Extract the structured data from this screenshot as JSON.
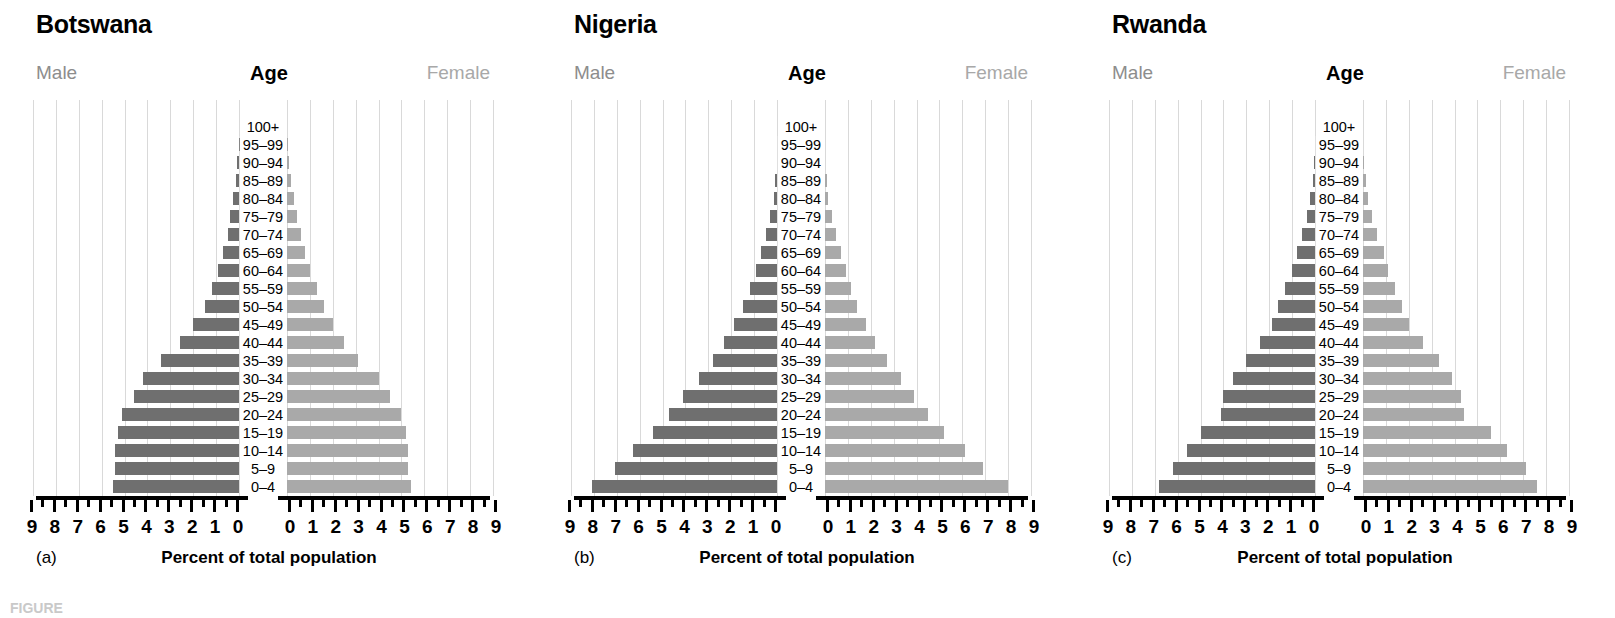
{
  "figure": {
    "caption": "FIGURE",
    "axis_title": "Percent of total population",
    "male_label": "Male",
    "female_label": "Female",
    "age_header": "Age",
    "male_color": "#6f6f6f",
    "female_color": "#a9a9a9",
    "grid_color": "#d9d9d9"
  },
  "age_groups": [
    "0–4",
    "5–9",
    "10–14",
    "15–19",
    "20–24",
    "25–29",
    "30–34",
    "35–39",
    "40–44",
    "45–49",
    "50–54",
    "55–59",
    "60–64",
    "65–69",
    "70–74",
    "75–79",
    "80–84",
    "85–89",
    "90–94",
    "95–99",
    "100+"
  ],
  "axis": {
    "ticks": [
      0,
      1,
      2,
      3,
      4,
      5,
      6,
      7,
      8,
      9
    ],
    "tick_labels_left": [
      "9",
      "8",
      "7",
      "6",
      "5",
      "4",
      "3",
      "2",
      "1",
      "0"
    ],
    "tick_labels_right": [
      "0",
      "1",
      "2",
      "3",
      "4",
      "5",
      "6",
      "7",
      "8",
      "9"
    ],
    "min": 0,
    "max": 9,
    "minor_per_major": 2
  },
  "panels": [
    {
      "letter": "(a)",
      "country": "Botswana",
      "chart_data": {
        "type": "bar",
        "title": "Botswana",
        "xlabel": "Percent of total population",
        "ylabel": "Age",
        "xlim": [
          0,
          9
        ],
        "grid": true,
        "categories": [
          "0–4",
          "5–9",
          "10–14",
          "15–19",
          "20–24",
          "25–29",
          "30–34",
          "35–39",
          "40–44",
          "45–49",
          "50–54",
          "55–59",
          "60–64",
          "65–69",
          "70–74",
          "75–79",
          "80–84",
          "85–89",
          "90–94",
          "95–99",
          "100+"
        ],
        "series": [
          {
            "name": "Male",
            "values": [
              5.5,
              5.4,
              5.4,
              5.3,
              5.1,
              4.6,
              4.2,
              3.4,
              2.6,
              2.0,
              1.5,
              1.2,
              0.9,
              0.7,
              0.5,
              0.4,
              0.25,
              0.15,
              0.07,
              0.02,
              0.0
            ]
          },
          {
            "name": "Female",
            "values": [
              5.4,
              5.3,
              5.3,
              5.2,
              5.0,
              4.5,
              4.0,
              3.1,
              2.5,
              2.0,
              1.6,
              1.3,
              1.0,
              0.8,
              0.6,
              0.45,
              0.3,
              0.18,
              0.08,
              0.03,
              0.0
            ]
          }
        ]
      }
    },
    {
      "letter": "(b)",
      "country": "Nigeria",
      "chart_data": {
        "type": "bar",
        "title": "Nigeria",
        "xlabel": "Percent of total population",
        "ylabel": "Age",
        "xlim": [
          0,
          9
        ],
        "grid": true,
        "categories": [
          "0–4",
          "5–9",
          "10–14",
          "15–19",
          "20–24",
          "25–29",
          "30–34",
          "35–39",
          "40–44",
          "45–49",
          "50–54",
          "55–59",
          "60–64",
          "65–69",
          "70–74",
          "75–79",
          "80–84",
          "85–89",
          "90–94",
          "95–99",
          "100+"
        ],
        "series": [
          {
            "name": "Male",
            "values": [
              8.1,
              7.1,
              6.3,
              5.4,
              4.7,
              4.1,
              3.4,
              2.8,
              2.3,
              1.9,
              1.5,
              1.2,
              0.9,
              0.7,
              0.5,
              0.3,
              0.15,
              0.08,
              0.0,
              0.0,
              0.0
            ]
          },
          {
            "name": "Female",
            "values": [
              8.0,
              6.9,
              6.1,
              5.2,
              4.5,
              3.9,
              3.3,
              2.7,
              2.2,
              1.8,
              1.4,
              1.15,
              0.9,
              0.7,
              0.5,
              0.3,
              0.15,
              0.08,
              0.0,
              0.0,
              0.0
            ]
          }
        ]
      }
    },
    {
      "letter": "(c)",
      "country": "Rwanda",
      "chart_data": {
        "type": "bar",
        "title": "Rwanda",
        "xlabel": "Percent of total population",
        "ylabel": "Age",
        "xlim": [
          0,
          9
        ],
        "grid": true,
        "categories": [
          "0–4",
          "5–9",
          "10–14",
          "15–19",
          "20–24",
          "25–29",
          "30–34",
          "35–39",
          "40–44",
          "45–49",
          "50–54",
          "55–59",
          "60–64",
          "65–69",
          "70–74",
          "75–79",
          "80–84",
          "85–89",
          "90–94",
          "95–99",
          "100+"
        ],
        "series": [
          {
            "name": "Male",
            "values": [
              6.8,
              6.2,
              5.6,
              5.0,
              4.1,
              4.0,
              3.6,
              3.0,
              2.4,
              1.9,
              1.6,
              1.3,
              1.0,
              0.8,
              0.55,
              0.35,
              0.2,
              0.1,
              0.04,
              0.0,
              0.0
            ]
          },
          {
            "name": "Female",
            "values": [
              7.6,
              7.1,
              6.3,
              5.6,
              4.4,
              4.3,
              3.9,
              3.3,
              2.6,
              2.0,
              1.7,
              1.4,
              1.1,
              0.9,
              0.6,
              0.4,
              0.22,
              0.12,
              0.05,
              0.0,
              0.0
            ]
          }
        ]
      }
    }
  ]
}
